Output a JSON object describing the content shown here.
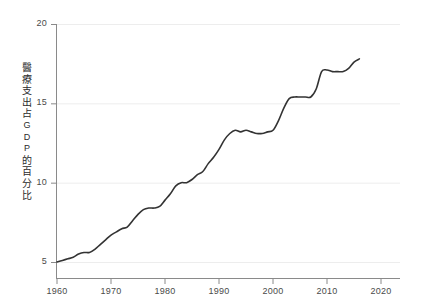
{
  "chart_data": {
    "type": "line",
    "title": "",
    "subtitle": "",
    "xlabel": "",
    "ylabel": "醫療支出占GDP的百分比",
    "ylabel_chars": [
      "醫",
      "療",
      "支",
      "出",
      "占",
      "G",
      "D",
      "P",
      "的",
      "百",
      "分",
      "比"
    ],
    "xlim": [
      1960,
      2020
    ],
    "ylim": [
      4.0,
      20.5
    ],
    "xticks": [
      1960,
      1970,
      1980,
      1990,
      2000,
      2010,
      2020
    ],
    "xtick_labels": [
      "1960",
      "1970",
      "1980",
      "1990",
      "2000",
      "2010",
      "2020"
    ],
    "yticks": [
      5,
      10,
      15,
      20
    ],
    "ytick_labels": [
      "5",
      "10",
      "15",
      "20"
    ],
    "grid": "horizontal-faint",
    "legend": "none",
    "line_color": "#333333",
    "line_width": 1.6,
    "axis_color": "#8a8a8a",
    "grid_color": "#ededed",
    "x": [
      1960,
      1961,
      1962,
      1963,
      1964,
      1965,
      1966,
      1967,
      1968,
      1969,
      1970,
      1971,
      1972,
      1973,
      1974,
      1975,
      1976,
      1977,
      1978,
      1979,
      1980,
      1981,
      1982,
      1983,
      1984,
      1985,
      1986,
      1987,
      1988,
      1989,
      1990,
      1991,
      1992,
      1993,
      1994,
      1995,
      1996,
      1997,
      1998,
      1999,
      2000,
      2001,
      2002,
      2003,
      2004,
      2005,
      2006,
      2007,
      2008,
      2009,
      2010,
      2011,
      2012,
      2013,
      2014,
      2015,
      2016
    ],
    "values": [
      5.0,
      5.1,
      5.2,
      5.3,
      5.5,
      5.6,
      5.6,
      5.8,
      6.1,
      6.4,
      6.7,
      6.9,
      7.1,
      7.2,
      7.6,
      8.0,
      8.3,
      8.4,
      8.4,
      8.5,
      8.9,
      9.3,
      9.8,
      10.0,
      10.0,
      10.2,
      10.5,
      10.7,
      11.2,
      11.6,
      12.1,
      12.7,
      13.1,
      13.3,
      13.2,
      13.3,
      13.2,
      13.1,
      13.1,
      13.2,
      13.3,
      13.9,
      14.7,
      15.3,
      15.4,
      15.4,
      15.4,
      15.4,
      15.9,
      17.0,
      17.1,
      17.0,
      17.0,
      17.0,
      17.2,
      17.6,
      17.8
    ]
  },
  "axes": {
    "y_ticks": [
      {
        "label": "20",
        "value": 20
      },
      {
        "label": "15",
        "value": 15
      },
      {
        "label": "10",
        "value": 10
      },
      {
        "label": "5",
        "value": 5
      }
    ],
    "x_ticks": [
      {
        "label": "1960",
        "value": 1960
      },
      {
        "label": "1970",
        "value": 1970
      },
      {
        "label": "1980",
        "value": 1980
      },
      {
        "label": "1990",
        "value": 1990
      },
      {
        "label": "2000",
        "value": 2000
      },
      {
        "label": "2010",
        "value": 2010
      },
      {
        "label": "2020",
        "value": 2020
      }
    ]
  },
  "ylabel_lines": [
    "醫",
    "療",
    "支",
    "出",
    "占",
    "G",
    "D",
    "P",
    "的",
    "百",
    "分",
    "比"
  ]
}
